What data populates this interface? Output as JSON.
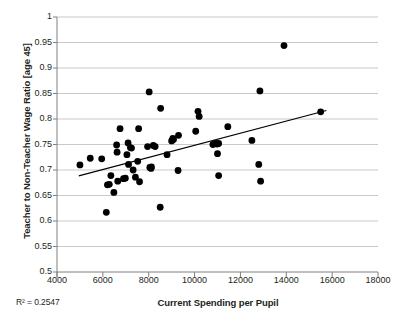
{
  "chart_data": {
    "type": "scatter",
    "title": "",
    "xlabel": "Current Spending per Pupil",
    "ylabel": "Teacher to Non-Teacher Wage Ratio [age 45]",
    "xlim": [
      4000,
      18000
    ],
    "ylim": [
      0.5,
      1
    ],
    "xticks": [
      4000,
      6000,
      8000,
      10000,
      12000,
      14000,
      16000,
      18000
    ],
    "yticks": [
      0.5,
      0.55,
      0.6,
      0.65,
      0.7,
      0.75,
      0.8,
      0.85,
      0.9,
      0.95,
      1
    ],
    "xtick_labels": [
      "4000",
      "6000",
      "8000",
      "10000",
      "12000",
      "14000",
      "16000",
      "18000"
    ],
    "ytick_labels": [
      "0.5",
      "0.55",
      "0.6",
      "0.65",
      "0.7",
      "0.75",
      "0.8",
      "0.85",
      "0.9",
      "0.95",
      "1"
    ],
    "grid": "horizontal",
    "legend": "none",
    "annotation": "R² = 0.2547",
    "r_squared": 0.2547,
    "marker": {
      "shape": "circle",
      "color": "#000000",
      "size": 3.4
    },
    "trendline": {
      "type": "linear",
      "color": "#000000",
      "x_start": 4950,
      "y_start": 0.6885,
      "x_end": 15750,
      "y_end": 0.8165
    },
    "points": [
      {
        "x": 5000,
        "y": 0.71
      },
      {
        "x": 5450,
        "y": 0.723
      },
      {
        "x": 5950,
        "y": 0.722
      },
      {
        "x": 6150,
        "y": 0.617
      },
      {
        "x": 6200,
        "y": 0.671
      },
      {
        "x": 6280,
        "y": 0.672
      },
      {
        "x": 6350,
        "y": 0.689
      },
      {
        "x": 6480,
        "y": 0.656
      },
      {
        "x": 6600,
        "y": 0.749
      },
      {
        "x": 6620,
        "y": 0.735
      },
      {
        "x": 6650,
        "y": 0.678
      },
      {
        "x": 6750,
        "y": 0.781
      },
      {
        "x": 6900,
        "y": 0.683
      },
      {
        "x": 6980,
        "y": 0.684
      },
      {
        "x": 7050,
        "y": 0.73
      },
      {
        "x": 7100,
        "y": 0.753
      },
      {
        "x": 7120,
        "y": 0.711
      },
      {
        "x": 7200,
        "y": 0.744
      },
      {
        "x": 7250,
        "y": 0.743
      },
      {
        "x": 7320,
        "y": 0.7
      },
      {
        "x": 7420,
        "y": 0.686
      },
      {
        "x": 7520,
        "y": 0.717
      },
      {
        "x": 7560,
        "y": 0.781
      },
      {
        "x": 7600,
        "y": 0.677
      },
      {
        "x": 7950,
        "y": 0.746
      },
      {
        "x": 8020,
        "y": 0.853
      },
      {
        "x": 8050,
        "y": 0.705
      },
      {
        "x": 8100,
        "y": 0.703
      },
      {
        "x": 8120,
        "y": 0.706
      },
      {
        "x": 8200,
        "y": 0.748
      },
      {
        "x": 8280,
        "y": 0.746
      },
      {
        "x": 8500,
        "y": 0.627
      },
      {
        "x": 8520,
        "y": 0.821
      },
      {
        "x": 8800,
        "y": 0.73
      },
      {
        "x": 9000,
        "y": 0.757
      },
      {
        "x": 9050,
        "y": 0.762
      },
      {
        "x": 9080,
        "y": 0.76
      },
      {
        "x": 9280,
        "y": 0.699
      },
      {
        "x": 9300,
        "y": 0.768
      },
      {
        "x": 10050,
        "y": 0.776
      },
      {
        "x": 10150,
        "y": 0.815
      },
      {
        "x": 10200,
        "y": 0.805
      },
      {
        "x": 10800,
        "y": 0.75
      },
      {
        "x": 10900,
        "y": 0.752
      },
      {
        "x": 10980,
        "y": 0.751
      },
      {
        "x": 11050,
        "y": 0.752
      },
      {
        "x": 11000,
        "y": 0.732
      },
      {
        "x": 11050,
        "y": 0.689
      },
      {
        "x": 11450,
        "y": 0.785
      },
      {
        "x": 12500,
        "y": 0.758
      },
      {
        "x": 12800,
        "y": 0.711
      },
      {
        "x": 12850,
        "y": 0.855
      },
      {
        "x": 12880,
        "y": 0.678
      },
      {
        "x": 13900,
        "y": 0.944
      },
      {
        "x": 15500,
        "y": 0.814
      }
    ]
  }
}
